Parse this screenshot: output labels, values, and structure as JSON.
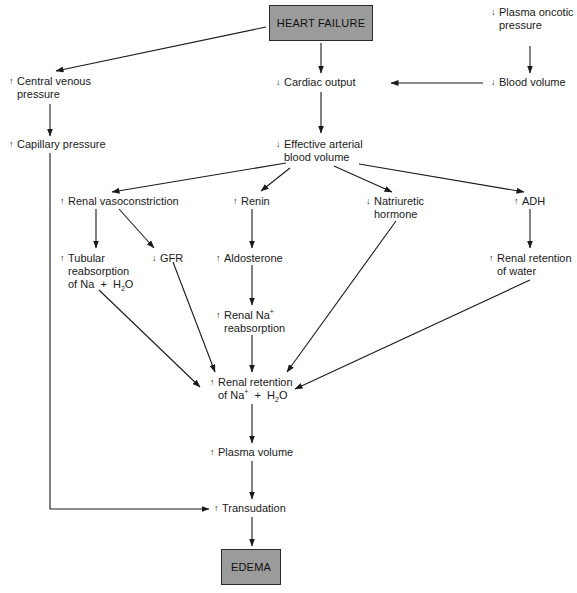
{
  "diagram": {
    "type": "flowchart",
    "colors": {
      "box_fill": "#9b9b9b",
      "box_border": "#2a2a2a",
      "line": "#1a1a1a",
      "background": "#ffffff"
    },
    "symbols": {
      "increase": "↑",
      "decrease": "↓"
    },
    "nodes": {
      "heart_failure": {
        "label": "HEART FAILURE",
        "kind": "box"
      },
      "plasma_oncotic": {
        "direction": "↓",
        "line1": "Plasma oncotic",
        "line2": "pressure"
      },
      "central_venous": {
        "direction": "↑",
        "line1": "Central venous",
        "line2": "pressure"
      },
      "cardiac_output": {
        "direction": "↓",
        "line1": "Cardiac output"
      },
      "blood_volume": {
        "direction": "↓",
        "line1": "Blood volume"
      },
      "capillary_pressure": {
        "direction": "↑",
        "line1": "Capillary pressure"
      },
      "effective_arterial": {
        "direction": "↓",
        "line1": "Effective arterial",
        "line2": "blood volume"
      },
      "renal_vasoconstriction": {
        "direction": "↑",
        "line1": "Renal vasoconstriction"
      },
      "renin": {
        "direction": "↑",
        "line1": "Renin"
      },
      "natriuretic": {
        "direction": "↓",
        "line1": "Natriuretic",
        "line2": "hormone"
      },
      "adh": {
        "direction": "↑",
        "line1": "ADH"
      },
      "tubular": {
        "direction": "↑",
        "line1": "Tubular",
        "line2": "reabsorption",
        "line3_pre": "of Na  +  H",
        "line3_sub": "2",
        "line3_post": "O"
      },
      "gfr": {
        "direction": "↓",
        "line1": "GFR"
      },
      "aldosterone": {
        "direction": "↑",
        "line1": "Aldosterone"
      },
      "renal_water": {
        "direction": "↑",
        "line1": "Renal retention",
        "line2": "of water"
      },
      "renal_na": {
        "direction": "↑",
        "line1_pre": "Renal Na",
        "line1_sup": "+",
        "line2": "reabsorption"
      },
      "renal_retention_na_h2o": {
        "direction": "↑",
        "line1": "Renal retention",
        "line2_pre": "of Na",
        "line2_sup": "+",
        "line2_mid": "  +  H",
        "line2_sub": "2",
        "line2_post": "O"
      },
      "plasma_volume": {
        "direction": "↑",
        "line1": "Plasma volume"
      },
      "transudation": {
        "direction": "↑",
        "line1": "Transudation"
      },
      "edema": {
        "label": "EDEMA",
        "kind": "box"
      }
    },
    "edges": [
      [
        "heart_failure",
        "central_venous"
      ],
      [
        "heart_failure",
        "cardiac_output"
      ],
      [
        "plasma_oncotic",
        "blood_volume"
      ],
      [
        "blood_volume",
        "cardiac_output"
      ],
      [
        "central_venous",
        "capillary_pressure"
      ],
      [
        "cardiac_output",
        "effective_arterial"
      ],
      [
        "effective_arterial",
        "renal_vasoconstriction"
      ],
      [
        "effective_arterial",
        "renin"
      ],
      [
        "effective_arterial",
        "natriuretic"
      ],
      [
        "effective_arterial",
        "adh"
      ],
      [
        "renal_vasoconstriction",
        "tubular"
      ],
      [
        "renal_vasoconstriction",
        "gfr"
      ],
      [
        "renin",
        "aldosterone"
      ],
      [
        "aldosterone",
        "renal_na"
      ],
      [
        "adh",
        "renal_water"
      ],
      [
        "tubular",
        "renal_retention_na_h2o"
      ],
      [
        "gfr",
        "renal_retention_na_h2o"
      ],
      [
        "renal_na",
        "renal_retention_na_h2o"
      ],
      [
        "natriuretic",
        "renal_retention_na_h2o"
      ],
      [
        "renal_water",
        "renal_retention_na_h2o"
      ],
      [
        "renal_retention_na_h2o",
        "plasma_volume"
      ],
      [
        "plasma_volume",
        "transudation"
      ],
      [
        "capillary_pressure",
        "transudation"
      ],
      [
        "transudation",
        "edema"
      ]
    ]
  }
}
